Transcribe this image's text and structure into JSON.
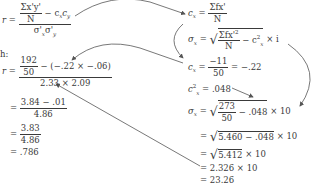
{
  "left": {
    "formula": {
      "lhs": "r",
      "eq": "=",
      "num_top": "Σx'y'",
      "num_bottom": "N",
      "num_tail": "− c",
      "den": "σ'",
      "sub_x": "x",
      "sub_y": "y"
    },
    "label_h": "h:",
    "step1": {
      "lhs": "r",
      "eq": "=",
      "inner_num": "192",
      "inner_den": "50",
      "num_tail": "− (−.22 × −.06)",
      "den": "2.33 × 2.09"
    },
    "step2": {
      "eq": "=",
      "num": "3.84 − .01",
      "den": "4.86"
    },
    "step3": {
      "eq": "=",
      "num": "3.83",
      "den": "4.86"
    },
    "step4": {
      "eq": "=",
      "value": ".786"
    }
  },
  "right": {
    "cx_def": {
      "lhs": "c",
      "sub": "x",
      "eq": "=",
      "num": "Σfx'",
      "den": "N"
    },
    "sx_def": {
      "lhs": "σ",
      "sub": "x",
      "eq": "=",
      "rad_num": "Σfx'",
      "rad_sup": "2",
      "rad_den": "N",
      "rad_tail": "− c",
      "rad_tail_sup": "2",
      "rad_tail_sub": "x",
      "tail": "× i"
    },
    "cx_val": {
      "lhs": "c",
      "sub": "x",
      "eq": "=",
      "num": "−11",
      "den": "50",
      "result": "= −.22"
    },
    "cx2_val": {
      "lhs": "c",
      "sup": "2",
      "sub": "x",
      "eq": "=",
      "value": ".048"
    },
    "sx_val": {
      "lhs": "σ",
      "sub": "x",
      "eq": "=",
      "rad_num": "273",
      "rad_den": "50",
      "rad_tail": "− .048",
      "tail": "× 10"
    },
    "line2": {
      "eq": "=",
      "rad": "5.460 − .048",
      "tail": "× 10"
    },
    "line3": {
      "eq": "=",
      "rad": "5.412",
      "tail": "× 10"
    },
    "line4": {
      "eq": "=",
      "value": "2.326 × 10"
    },
    "line5": {
      "eq": "=",
      "value": "23.26"
    }
  },
  "colors": {
    "text": "#3a3a3a",
    "arrow": "#555555"
  }
}
